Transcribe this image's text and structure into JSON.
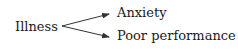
{
  "diagram": {
    "source": {
      "label": "Illness"
    },
    "targets": [
      {
        "label": "Anxiety"
      },
      {
        "label": "Poor performance"
      }
    ],
    "edges": [
      {
        "from": "Illness",
        "to": "Anxiety"
      },
      {
        "from": "Illness",
        "to": "Poor performance"
      }
    ],
    "colors": {
      "text": "#1a1a1a",
      "arrow": "#333333",
      "background": "#ffffff"
    }
  }
}
